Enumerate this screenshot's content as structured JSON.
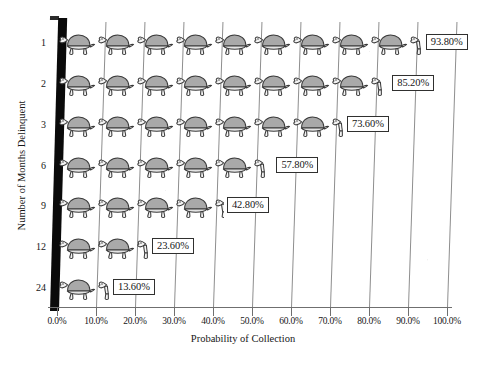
{
  "chart_data": {
    "type": "bar",
    "subtype": "horizontal-pictogram",
    "title": "",
    "xlabel": "Probability of Collection",
    "ylabel": "Number of Months Delinquent",
    "categories": [
      "1",
      "2",
      "3",
      "6",
      "9",
      "12",
      "24"
    ],
    "values": [
      93.8,
      85.2,
      73.6,
      57.8,
      42.8,
      23.6,
      13.6
    ],
    "value_labels": [
      "93.80%",
      "85.20%",
      "73.60%",
      "57.80%",
      "42.80%",
      "23.60%",
      "13.60%"
    ],
    "xlim": [
      0,
      100
    ],
    "xtick_labels": [
      "0.0%",
      "10.0%",
      "20.0%",
      "30.0%",
      "40.0%",
      "50.0%",
      "60.0%",
      "70.0%",
      "80.0%",
      "90.0%",
      "100.0%"
    ],
    "xtick_values": [
      0,
      10,
      20,
      30,
      40,
      50,
      60,
      70,
      80,
      90,
      100
    ],
    "grid": "vertical",
    "legend": "none",
    "icon": "turtle-icon",
    "icon_unit_value": 10,
    "icon_shell_color": "#a9a9a9",
    "icon_outline_color": "#3a3a3a",
    "gridline_color": "#8e8e8e",
    "axis_color": "#6f6f6f",
    "spine_color": "#0a0a0a",
    "label_box_border_color": "#30302f",
    "label_box_fill_color": "#ffffff",
    "background_color": "#ffffff"
  }
}
